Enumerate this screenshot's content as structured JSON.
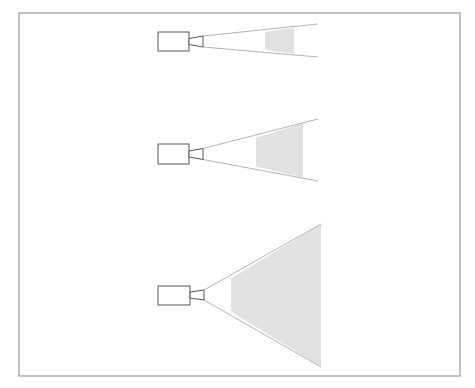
{
  "figure": {
    "title": "",
    "colors": {
      "frame": "#9a9a9a",
      "camera_outline": "#555555",
      "ray": "#a8a8a8",
      "shaded_region": "#e1e1e1",
      "background": "#ffffff"
    },
    "frame": {
      "x": 19,
      "y": 13,
      "width": 441,
      "height": 363
    },
    "panels": [
      {
        "name": "camera-1-narrow",
        "camera_body": {
          "x": 158,
          "y": 32,
          "width": 31,
          "height": 19
        },
        "lens": {
          "x0": 189,
          "x1": 203,
          "inner_half": 3,
          "outer_half": 5.5,
          "cy": 41.5
        },
        "apex": {
          "x": 203,
          "y": 41.5
        },
        "ray_end_x": 318,
        "ray_top_end_y": 24,
        "ray_bottom_end_y": 57,
        "shaded_x0": 265,
        "shaded_x1": 294
      },
      {
        "name": "camera-2-medium",
        "camera_body": {
          "x": 158,
          "y": 144,
          "width": 31,
          "height": 20
        },
        "lens": {
          "x0": 189,
          "x1": 203,
          "inner_half": 3,
          "outer_half": 5.5,
          "cy": 154
        },
        "apex": {
          "x": 203,
          "y": 154
        },
        "ray_end_x": 318,
        "ray_top_end_y": 119,
        "ray_bottom_end_y": 181,
        "shaded_x0": 256,
        "shaded_x1": 303
      },
      {
        "name": "camera-3-wide",
        "camera_body": {
          "x": 158,
          "y": 286,
          "width": 32,
          "height": 19
        },
        "lens": {
          "x0": 190,
          "x1": 204,
          "inner_half": 3,
          "outer_half": 5,
          "cy": 295
        },
        "apex": {
          "x": 204,
          "y": 295
        },
        "ray_end_x": 321,
        "ray_top_end_y": 224,
        "ray_bottom_end_y": 367,
        "shaded_x0": 231,
        "shaded_x1": 321
      }
    ]
  }
}
